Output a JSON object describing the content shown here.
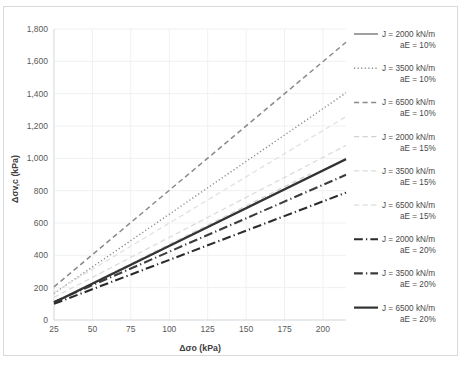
{
  "chart_data": {
    "type": "line",
    "title": "",
    "xlabel": "Δσo (kPa)",
    "ylabel": "Δσv,c (kPa)",
    "xlim": [
      25,
      215
    ],
    "ylim": [
      0,
      1800
    ],
    "x_ticks": [
      25,
      50,
      75,
      100,
      125,
      150,
      175,
      200
    ],
    "x_tick_labels": [
      "25",
      "50",
      "75",
      "100",
      "125",
      "150",
      "175",
      "200"
    ],
    "y_ticks": [
      0,
      200,
      400,
      600,
      800,
      1000,
      1200,
      1400,
      1600,
      1800
    ],
    "y_tick_labels": [
      "0",
      "200",
      "400",
      "600",
      "800",
      "1,000",
      "1,200",
      "1,400",
      "1,600",
      "1,800"
    ],
    "grid": true,
    "legend_position": "right",
    "series": [
      {
        "name": "J = 2000 kN/m\naE = 10%",
        "label_line1": "J = 2000 kN/m",
        "label_line2": "aE = 10%",
        "style": "solid",
        "color": "#808080",
        "width": 1.5,
        "x": [
          25,
          215
        ],
        "y": [
          108,
          998
        ]
      },
      {
        "name": "J = 3500 kN/m\naE = 10%",
        "label_line1": "J = 3500 kN/m",
        "label_line2": "aE = 10%",
        "style": "dotted",
        "color": "#8a8a8a",
        "width": 1.4,
        "x": [
          25,
          215
        ],
        "y": [
          165,
          1405
        ]
      },
      {
        "name": "J = 6500 kN/m\naE = 10%",
        "label_line1": "J = 6500 kN/m",
        "label_line2": "aE = 10%",
        "style": "dashed",
        "color": "#8a8a8a",
        "width": 1.5,
        "x": [
          25,
          215
        ],
        "y": [
          205,
          1718
        ]
      },
      {
        "name": "J = 2000 kN/m\naE = 15%",
        "label_line1": "J = 2000 kN/m",
        "label_line2": "aE = 15%",
        "style": "dashed-light",
        "color": "#d2d2d2",
        "width": 1.3,
        "x": [
          25,
          192
        ],
        "y": [
          112,
          905
        ]
      },
      {
        "name": "J = 3500 kN/m\naE = 15%",
        "label_line1": "J = 3500 kN/m",
        "label_line2": "aE = 15%",
        "style": "dashed-light",
        "color": "#dcdcdc",
        "width": 1.3,
        "x": [
          25,
          215
        ],
        "y": [
          140,
          1080
        ]
      },
      {
        "name": "J = 6500 kN/m\naE = 15%",
        "label_line1": "J = 6500 kN/m",
        "label_line2": "aE = 15%",
        "style": "dashed-light",
        "color": "#e2e2e2",
        "width": 1.3,
        "x": [
          25,
          215
        ],
        "y": [
          170,
          1258
        ]
      },
      {
        "name": "J = 2000 kN/m\naE = 20%",
        "label_line1": "J = 2000 kN/m",
        "label_line2": "aE = 20%",
        "style": "dashdot",
        "color": "#2b2b2b",
        "width": 2.1,
        "x": [
          25,
          215
        ],
        "y": [
          100,
          788
        ]
      },
      {
        "name": "J = 3500 kN/m\naE = 20%",
        "label_line1": "J = 3500 kN/m",
        "label_line2": "aE = 20%",
        "style": "dashdot",
        "color": "#3c3c3c",
        "width": 2.1,
        "x": [
          25,
          215
        ],
        "y": [
          112,
          898
        ]
      },
      {
        "name": "J = 6500 kN/m\naE = 20%",
        "label_line1": "J = 6500 kN/m",
        "label_line2": "aE = 20%",
        "style": "solid-thick",
        "color": "#333333",
        "width": 2.2,
        "x": [
          25,
          215
        ],
        "y": [
          108,
          995
        ]
      }
    ]
  }
}
